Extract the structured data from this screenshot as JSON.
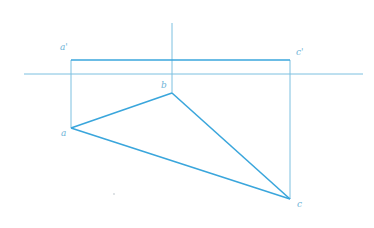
{
  "diagram": {
    "type": "orthographic-projection",
    "colors": {
      "thin_line": "#7cc0e0",
      "thick_line": "#3aa6dc",
      "label": "#6fb4d8",
      "background": "#ffffff"
    },
    "labels": {
      "a_prime": "a'",
      "c_prime": "c'",
      "b": "b",
      "a": "a",
      "c": "c"
    },
    "points": {
      "a_prime": [
        71,
        60
      ],
      "c_prime": [
        290,
        60
      ],
      "b": [
        172,
        93
      ],
      "a": [
        71,
        128
      ],
      "c": [
        290,
        199
      ]
    },
    "axis": {
      "x1": 24,
      "x2": 363,
      "y": 74
    },
    "vertical_ref": {
      "x": 172,
      "y1": 23,
      "y2": 93
    }
  }
}
